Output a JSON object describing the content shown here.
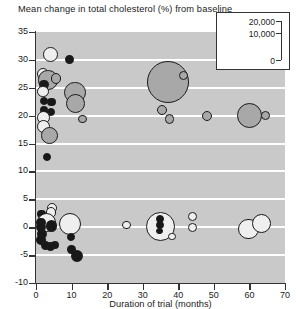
{
  "chart_data": {
    "type": "scatter",
    "title": "Mean change in total cholesterol (%) from baseline",
    "xlabel": "Duration of trial (months)",
    "ylabel": "",
    "xlim": [
      0,
      70
    ],
    "ylim": [
      -10,
      35
    ],
    "xticks": [
      0,
      10,
      20,
      30,
      40,
      50,
      60,
      70
    ],
    "yticks": [
      -10,
      -5,
      0,
      5,
      10,
      15,
      20,
      25,
      30,
      35
    ],
    "grid": "horizontal white bands at every 5 units",
    "bubble_size_encodes": "number of participants",
    "legend": {
      "position": "top-right inset box",
      "entries": [
        "20,000",
        "10,000",
        "0"
      ]
    },
    "marker_styles": {
      "open": "white/unfilled circle with dark outline",
      "gray": "gray filled circle with dark outline",
      "solid": "solid black filled circle"
    },
    "points": [
      {
        "x": 4.0,
        "y": 31.0,
        "size": 2500,
        "style": "open"
      },
      {
        "x": 9.5,
        "y": 30.0,
        "size": 900,
        "style": "solid"
      },
      {
        "x": 2.0,
        "y": 27.5,
        "size": 1800,
        "style": "open"
      },
      {
        "x": 3.4,
        "y": 26.4,
        "size": 4200,
        "style": "gray"
      },
      {
        "x": 5.6,
        "y": 26.6,
        "size": 1300,
        "style": "gray"
      },
      {
        "x": 2.2,
        "y": 25.6,
        "size": 1100,
        "style": "solid"
      },
      {
        "x": 2.0,
        "y": 24.3,
        "size": 1500,
        "style": "open"
      },
      {
        "x": 37.0,
        "y": 26.0,
        "size": 20000,
        "style": "gray"
      },
      {
        "x": 41.5,
        "y": 27.2,
        "size": 900,
        "style": "gray"
      },
      {
        "x": 11.0,
        "y": 24.2,
        "size": 5200,
        "style": "gray"
      },
      {
        "x": 11.0,
        "y": 22.2,
        "size": 4200,
        "style": "gray"
      },
      {
        "x": 2.2,
        "y": 22.6,
        "size": 700,
        "style": "solid"
      },
      {
        "x": 4.4,
        "y": 22.4,
        "size": 800,
        "style": "solid"
      },
      {
        "x": 2.2,
        "y": 21.0,
        "size": 800,
        "style": "solid"
      },
      {
        "x": 4.2,
        "y": 20.6,
        "size": 700,
        "style": "solid"
      },
      {
        "x": 2.1,
        "y": 19.6,
        "size": 1900,
        "style": "open"
      },
      {
        "x": 2.1,
        "y": 18.0,
        "size": 1900,
        "style": "open"
      },
      {
        "x": 35.5,
        "y": 21.0,
        "size": 1200,
        "style": "gray"
      },
      {
        "x": 37.5,
        "y": 19.4,
        "size": 1000,
        "style": "gray"
      },
      {
        "x": 48.0,
        "y": 20.0,
        "size": 1200,
        "style": "gray"
      },
      {
        "x": 60.0,
        "y": 20.0,
        "size": 7000,
        "style": "gray"
      },
      {
        "x": 64.5,
        "y": 20.0,
        "size": 900,
        "style": "gray"
      },
      {
        "x": 13.0,
        "y": 19.4,
        "size": 900,
        "style": "gray"
      },
      {
        "x": 3.8,
        "y": 16.4,
        "size": 3200,
        "style": "gray"
      },
      {
        "x": 3.2,
        "y": 12.6,
        "size": 700,
        "style": "solid"
      },
      {
        "x": 4.4,
        "y": 3.4,
        "size": 1100,
        "style": "open"
      },
      {
        "x": 1.6,
        "y": 2.4,
        "size": 800,
        "style": "solid"
      },
      {
        "x": 4.2,
        "y": 2.6,
        "size": 1300,
        "style": "open"
      },
      {
        "x": 3.0,
        "y": 0.8,
        "size": 4200,
        "style": "open"
      },
      {
        "x": 1.4,
        "y": 0.9,
        "size": 1000,
        "style": "solid"
      },
      {
        "x": 1.5,
        "y": 0.0,
        "size": 1200,
        "style": "solid"
      },
      {
        "x": 4.4,
        "y": 0.2,
        "size": 1500,
        "style": "solid"
      },
      {
        "x": 1.6,
        "y": -1.2,
        "size": 1100,
        "style": "solid"
      },
      {
        "x": 1.4,
        "y": -2.3,
        "size": 1000,
        "style": "solid"
      },
      {
        "x": 2.6,
        "y": -3.3,
        "size": 900,
        "style": "solid"
      },
      {
        "x": 4.0,
        "y": -3.4,
        "size": 900,
        "style": "solid"
      },
      {
        "x": 5.4,
        "y": -3.2,
        "size": 800,
        "style": "solid"
      },
      {
        "x": 9.5,
        "y": 0.6,
        "size": 5600,
        "style": "open"
      },
      {
        "x": 9.8,
        "y": -1.8,
        "size": 700,
        "style": "solid"
      },
      {
        "x": 10.0,
        "y": -4.0,
        "size": 800,
        "style": "solid"
      },
      {
        "x": 11.6,
        "y": -5.2,
        "size": 1600,
        "style": "solid"
      },
      {
        "x": 25.5,
        "y": 0.4,
        "size": 900,
        "style": "open"
      },
      {
        "x": 35.0,
        "y": 0.2,
        "size": 9500,
        "style": "open"
      },
      {
        "x": 34.8,
        "y": 1.4,
        "size": 700,
        "style": "solid"
      },
      {
        "x": 34.8,
        "y": 0.4,
        "size": 700,
        "style": "solid"
      },
      {
        "x": 34.8,
        "y": -0.7,
        "size": 500,
        "style": "solid"
      },
      {
        "x": 38.2,
        "y": -1.6,
        "size": 600,
        "style": "open"
      },
      {
        "x": 44.0,
        "y": 2.0,
        "size": 900,
        "style": "open"
      },
      {
        "x": 44.0,
        "y": 0.0,
        "size": 900,
        "style": "open"
      },
      {
        "x": 59.8,
        "y": -0.3,
        "size": 4800,
        "style": "open"
      },
      {
        "x": 63.5,
        "y": 0.7,
        "size": 4200,
        "style": "open"
      }
    ]
  }
}
